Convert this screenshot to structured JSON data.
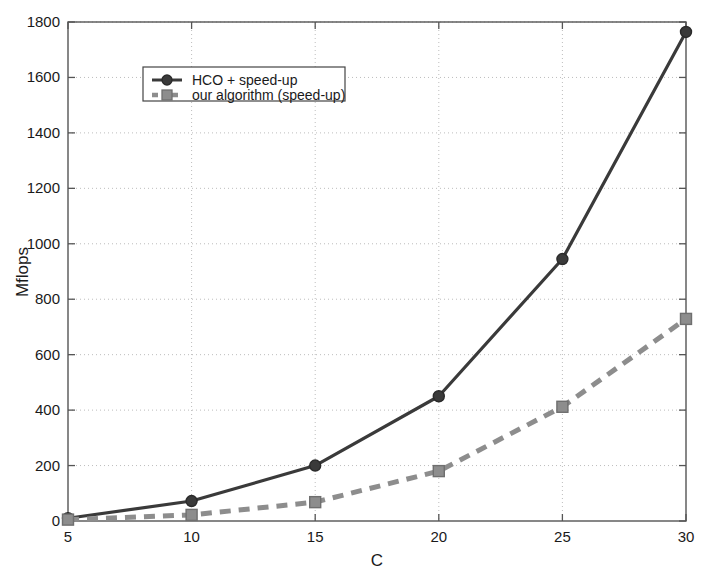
{
  "chart_data": {
    "type": "line",
    "title": "",
    "xlabel": "C",
    "ylabel": "Mflops",
    "x": [
      5,
      10,
      15,
      20,
      25,
      30
    ],
    "xticks": [
      "5",
      "10",
      "15",
      "20",
      "25",
      "30"
    ],
    "yticks": [
      "0",
      "200",
      "400",
      "600",
      "800",
      "1000",
      "1200",
      "1400",
      "1600",
      "1800"
    ],
    "xlim": [
      5,
      30
    ],
    "ylim": [
      0,
      1800
    ],
    "grid": true,
    "legend_position": "upper-left",
    "series": [
      {
        "name": "HCO + speed-up",
        "values": [
          10,
          72,
          200,
          450,
          945,
          1764
        ],
        "color": "#3a3a3a",
        "line_style": "solid",
        "marker": "circle"
      },
      {
        "name": "our algorithm (speed-up)",
        "values": [
          5,
          22,
          68,
          180,
          412,
          729
        ],
        "color": "#8d8d8d",
        "line_style": "dashed",
        "marker": "square"
      }
    ]
  },
  "legend": {
    "entries": [
      {
        "label": "HCO + speed-up"
      },
      {
        "label": "our algorithm (speed-up)"
      }
    ]
  },
  "axes": {
    "x_title": "C",
    "y_title": "Mflops"
  }
}
